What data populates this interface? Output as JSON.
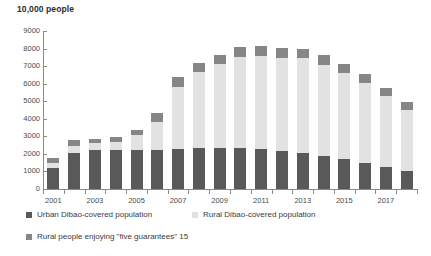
{
  "chart_data": {
    "type": "bar",
    "subtype": "stacked",
    "title": "10,000 people",
    "xlabel": "",
    "ylabel": "",
    "ylim": [
      0,
      9000
    ],
    "ytick_step": 1000,
    "yticks": [
      0,
      1000,
      2000,
      3000,
      4000,
      5000,
      6000,
      7000,
      8000,
      9000
    ],
    "grid": false,
    "legend_position": "bottom",
    "categories": [
      "2001",
      "2002",
      "2003",
      "2004",
      "2005",
      "2006",
      "2007",
      "2008",
      "2009",
      "2010",
      "2011",
      "2012",
      "2013",
      "2014",
      "2015",
      "2016",
      "2017",
      "2018"
    ],
    "xtick_labels_shown": [
      "2001",
      "2003",
      "2005",
      "2007",
      "2009",
      "2011",
      "2013",
      "2015",
      "2017"
    ],
    "series": [
      {
        "name": "Urban Dibao-covered population",
        "color": "#595959",
        "values": [
          1171,
          2065,
          2247,
          2205,
          2234,
          2241,
          2272,
          2335,
          2346,
          2311,
          2277,
          2144,
          2064,
          1877,
          1702,
          1480,
          1261,
          1008
        ]
      },
      {
        "name": "Rural Dibao-covered population",
        "color": "#e2e2e2",
        "values": [
          305,
          408,
          368,
          488,
          825,
          1593,
          3566,
          4306,
          4760,
          5214,
          5306,
          5345,
          5388,
          5207,
          4903,
          4586,
          4047,
          3519
        ]
      },
      {
        "name": "Rural people enjoying \"five guarantees\" 15",
        "color": "#868686",
        "values": [
          304,
          298,
          254,
          254,
          328,
          503,
          531,
          548,
          553,
          556,
          551,
          545,
          537,
          529,
          517,
          497,
          467,
          455
        ]
      }
    ]
  },
  "legend": {
    "items": [
      {
        "label": "Urban Dibao-covered population",
        "color": "#595959"
      },
      {
        "label": "Rural Dibao-covered population",
        "color": "#e2e2e2"
      },
      {
        "label": "Rural people enjoying \"five guarantees\" 15",
        "color": "#868686"
      }
    ]
  }
}
